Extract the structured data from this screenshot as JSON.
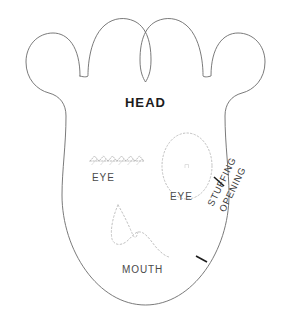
{
  "document": {
    "kind": "sewing-pattern-template",
    "title": "HEAD"
  },
  "colors": {
    "background": "#ffffff",
    "outline": "#6b6b6b",
    "guide_dotted": "#b9b9b9",
    "tick_mark": "#1c1c1c",
    "label_text": "#4a4a4a",
    "title_text": "#1c1c1c"
  },
  "labels": {
    "head": "HEAD",
    "eye_left": "EYE",
    "eye_right": "EYE",
    "mouth": "MOUTH",
    "stuffing_opening_line1": "STUFFING",
    "stuffing_opening_line2": "OPENING"
  },
  "pieces": {
    "outline": {
      "name": "head-outline",
      "description": "Rounded head body with two tall ear lobes at top and two smaller side lobes"
    },
    "eye_left_guide": {
      "name": "eye-left-zigzag-stitch",
      "style": "dotted-zigzag"
    },
    "eye_right_guide": {
      "name": "eye-right-oval",
      "style": "dotted-oval"
    },
    "mouth_guide": {
      "name": "mouth-curve",
      "style": "dotted-curve"
    }
  },
  "markers": {
    "stuffing_opening_start": "tick-mark-upper",
    "stuffing_opening_end": "tick-mark-lower"
  }
}
